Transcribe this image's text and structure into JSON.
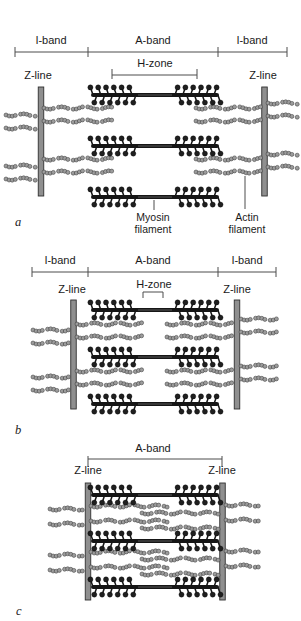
{
  "figure": {
    "name": "sarcomere contraction stages",
    "colors": {
      "line": "#4d4d4d",
      "text": "#1a1a1a",
      "myosin": "#161616",
      "myosin_head": "#1f1f1f",
      "myosin_midline": "#6a6a6a",
      "actin_fill": "#9c9c9c",
      "actin_stroke": "#3a3a3a",
      "zline_fill": "#8f8f8f",
      "zline_stroke": "#2f2f2f",
      "background": "#ffffff"
    },
    "panels": [
      {
        "letter": "a",
        "labels": {
          "i_band_left": "I-band",
          "a_band": "A-band",
          "i_band_right": "I-band",
          "h_zone": "H-zone",
          "z_line_left": "Z-line",
          "z_line_right": "Z-line",
          "myosin_filament": "Myosin filament",
          "actin_filament": "Actin filament"
        },
        "geometry": {
          "band_bracket": {
            "y": 52,
            "x1": 15,
            "x2": 287,
            "ticks": [
              15,
              88,
              218,
              287
            ],
            "tick_up": 5,
            "tick_down": 5
          },
          "hzone_bracket": {
            "y": 75,
            "x1": 112,
            "x2": 197,
            "tick_up": 6,
            "tick_down": 4
          },
          "zlines": [
            {
              "cx": 41,
              "y1": 87,
              "y2": 196
            },
            {
              "cx": 264.5,
              "y1": 87,
              "y2": 196
            }
          ],
          "myosin": {
            "x1": 89,
            "x2": 221,
            "bare": 20,
            "cys": [
              95,
              146,
              197
            ]
          },
          "actin": [
            {
              "y": 108,
              "x1": 44,
              "x2": 112
            },
            {
              "y": 121,
              "x1": 44,
              "x2": 112
            },
            {
              "y": 115,
              "x1": 6,
              "x2": 37
            },
            {
              "y": 128,
              "x1": 6,
              "x2": 37
            },
            {
              "y": 108,
              "x1": 196,
              "x2": 261
            },
            {
              "y": 121,
              "x1": 196,
              "x2": 261
            },
            {
              "y": 103,
              "x1": 268,
              "x2": 298
            },
            {
              "y": 116,
              "x1": 268,
              "x2": 298
            },
            {
              "y": 159,
              "x1": 44,
              "x2": 112
            },
            {
              "y": 172,
              "x1": 44,
              "x2": 112
            },
            {
              "y": 166,
              "x1": 6,
              "x2": 37
            },
            {
              "y": 179,
              "x1": 6,
              "x2": 37
            },
            {
              "y": 159,
              "x1": 196,
              "x2": 261
            },
            {
              "y": 172,
              "x1": 196,
              "x2": 261
            },
            {
              "y": 154,
              "x1": 268,
              "x2": 298
            },
            {
              "y": 167,
              "x1": 268,
              "x2": 298
            }
          ],
          "pointers": [
            {
              "x": 154,
              "y1": 200,
              "y2": 210
            },
            {
              "x": 245,
              "y1": 176,
              "y2": 209
            }
          ]
        }
      },
      {
        "letter": "b",
        "labels": {
          "i_band_left": "I-band",
          "a_band": "A-band",
          "i_band_right": "I-band",
          "h_zone": "H-zone",
          "z_line_left": "Z-line",
          "z_line_right": "Z-line"
        },
        "geometry": {
          "band_bracket": {
            "y": 272,
            "x1": 32,
            "x2": 276,
            "ticks": [
              32,
              88,
              218,
              276
            ],
            "tick_up": 5,
            "tick_down": 5
          },
          "hzone_bracket": {
            "y": 292,
            "x1": 143,
            "x2": 163,
            "tick_up": 0,
            "tick_down": 6
          },
          "zlines": [
            {
              "cx": 73.5,
              "y1": 300,
              "y2": 409
            },
            {
              "cx": 237,
              "y1": 300,
              "y2": 409
            }
          ],
          "myosin": {
            "x1": 89,
            "x2": 221,
            "bare": 20,
            "cys": [
              310,
              357,
              404
            ]
          },
          "actin": [
            {
              "y": 324,
              "x1": 77,
              "x2": 143
            },
            {
              "y": 337,
              "x1": 77,
              "x2": 143
            },
            {
              "y": 330,
              "x1": 33,
              "x2": 70
            },
            {
              "y": 343,
              "x1": 33,
              "x2": 70
            },
            {
              "y": 324,
              "x1": 167,
              "x2": 233
            },
            {
              "y": 337,
              "x1": 167,
              "x2": 233
            },
            {
              "y": 319,
              "x1": 241,
              "x2": 278
            },
            {
              "y": 332,
              "x1": 241,
              "x2": 278
            },
            {
              "y": 371,
              "x1": 77,
              "x2": 143
            },
            {
              "y": 384,
              "x1": 77,
              "x2": 143
            },
            {
              "y": 377,
              "x1": 33,
              "x2": 70
            },
            {
              "y": 390,
              "x1": 33,
              "x2": 70
            },
            {
              "y": 371,
              "x1": 167,
              "x2": 233
            },
            {
              "y": 384,
              "x1": 167,
              "x2": 233
            },
            {
              "y": 366,
              "x1": 241,
              "x2": 278
            },
            {
              "y": 379,
              "x1": 241,
              "x2": 278
            }
          ],
          "pointers": []
        }
      },
      {
        "letter": "c",
        "labels": {
          "a_band": "A-band",
          "z_line_left": "Z-line",
          "z_line_right": "Z-line"
        },
        "geometry": {
          "band_bracket": {
            "y": 459,
            "x1": 88,
            "x2": 222,
            "ticks": [
              88,
              222
            ],
            "tick_up": 3,
            "tick_down": 8
          },
          "zlines": [
            {
              "cx": 88,
              "y1": 483,
              "y2": 600
            },
            {
              "cx": 222.5,
              "y1": 483,
              "y2": 600
            }
          ],
          "myosin": {
            "x1": 89,
            "x2": 221,
            "bare": 20,
            "cys": [
              495,
              541,
              587
            ]
          },
          "actin": [
            {
              "y": 506,
              "x1": 91,
              "x2": 168
            },
            {
              "y": 513,
              "x1": 142,
              "x2": 220
            },
            {
              "y": 521,
              "x1": 91,
              "x2": 168
            },
            {
              "y": 528,
              "x1": 142,
              "x2": 220
            },
            {
              "y": 509,
              "x1": 50,
              "x2": 85
            },
            {
              "y": 524,
              "x1": 50,
              "x2": 85
            },
            {
              "y": 505,
              "x1": 226,
              "x2": 261
            },
            {
              "y": 520,
              "x1": 226,
              "x2": 261
            },
            {
              "y": 552,
              "x1": 91,
              "x2": 168
            },
            {
              "y": 559,
              "x1": 142,
              "x2": 220
            },
            {
              "y": 567,
              "x1": 91,
              "x2": 168
            },
            {
              "y": 574,
              "x1": 142,
              "x2": 220
            },
            {
              "y": 555,
              "x1": 50,
              "x2": 85
            },
            {
              "y": 570,
              "x1": 50,
              "x2": 85
            },
            {
              "y": 551,
              "x1": 226,
              "x2": 261
            },
            {
              "y": 566,
              "x1": 226,
              "x2": 261
            }
          ],
          "pointers": []
        }
      }
    ]
  }
}
